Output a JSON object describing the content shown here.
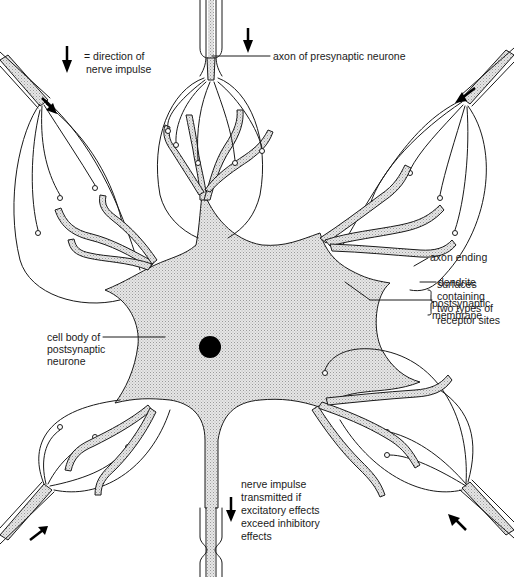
{
  "diagram": {
    "colors": {
      "line": "#1a1a1a",
      "stipple": "#d9d9d9",
      "background": "#ffffff",
      "nucleus": "#000000"
    }
  },
  "legend": {
    "arrow_icon": "down-arrow",
    "line1": "= direction of",
    "line2": "nerve impulse"
  },
  "labels": {
    "axon_presynaptic": "axon of presynaptic neurone",
    "axon_ending": "axon ending",
    "dendrite": "dendrite",
    "postsynaptic_membrane": [
      "postsynaptic",
      "membrane"
    ],
    "surfaces": [
      "surfaces",
      "containing",
      "two types of",
      "receptor sites"
    ],
    "cell_body": [
      "cell body of",
      "postsynaptic",
      "neurone"
    ],
    "output": [
      "nerve impulse",
      "transmitted if",
      "excitatory effects",
      "exceed inhibitory",
      "effects"
    ]
  }
}
